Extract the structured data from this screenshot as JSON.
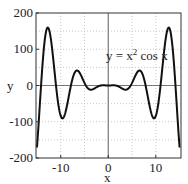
{
  "chart_data": {
    "type": "line",
    "title": "",
    "xlabel": "x",
    "ylabel": "y",
    "xlim": [
      -15.2,
      15.3
    ],
    "ylim": [
      -200,
      200
    ],
    "xticks": [
      -10,
      0,
      10
    ],
    "xtick_labels": [
      "-10",
      "0",
      "10"
    ],
    "yticks": [
      200,
      100,
      0,
      -100,
      -200
    ],
    "ytick_labels": [
      "200",
      "100",
      "0",
      "-100",
      "-200"
    ],
    "x_grid": [
      -10,
      -5,
      0,
      5,
      10
    ],
    "y_grid": [
      150,
      100,
      50,
      -50,
      -100,
      -150
    ],
    "grid": true,
    "annotation": {
      "text_main": "y = x",
      "text_sup": "2",
      "text_tail": " cos x",
      "x": 0,
      "y": 100
    },
    "series": [
      {
        "name": "y = x^2 cos x",
        "function": "x^2 cos x",
        "x": [
          -15,
          -14,
          -13,
          -12.6,
          -12,
          -11,
          -10,
          -9.6,
          -9,
          -8,
          -7,
          -6.4,
          -6,
          -5,
          -4,
          -3.6,
          -3,
          -2,
          -1,
          0,
          1,
          2,
          3,
          3.6,
          4,
          5,
          6,
          6.4,
          7,
          8,
          9,
          9.6,
          10,
          11,
          12,
          12.6,
          13,
          14,
          15
        ],
        "values": [
          -171.9,
          26.6,
          152.3,
          158.9,
          121.5,
          0.5,
          -83.9,
          -90.5,
          -73.8,
          -9.3,
          36.9,
          40.6,
          34.6,
          7.1,
          -10.5,
          -11.5,
          -8.9,
          -1.7,
          0.5,
          0,
          0.5,
          -1.7,
          -8.9,
          -11.5,
          -10.5,
          7.1,
          34.6,
          40.6,
          36.9,
          -9.3,
          -73.8,
          -90.5,
          -83.9,
          0.5,
          121.5,
          158.9,
          152.3,
          26.6,
          -171.9
        ]
      }
    ],
    "colors": {
      "line": "#111111",
      "axis": "#333333",
      "grid": "#bbbbbb",
      "zero": "#777777"
    }
  }
}
